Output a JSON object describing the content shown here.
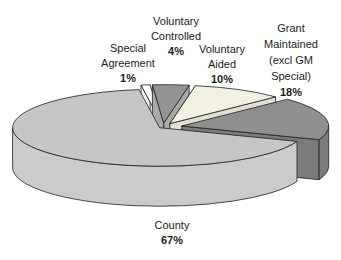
{
  "chart_data": {
    "type": "pie",
    "style": "3d-exploded",
    "legend_position": "none",
    "labels": [
      "Special Agreement",
      "Voluntary Controlled",
      "Voluntary Aided",
      "Grant Maintained (excl GM Special)",
      "County"
    ],
    "values": [
      1,
      4,
      10,
      18,
      67
    ],
    "unit": "%",
    "slices": [
      {
        "id": "special-agreement",
        "label": "Special Agreement",
        "display": "Special\nAgreement",
        "pct": "1%",
        "value": 1,
        "top_color": "#fdfdfd",
        "side_color": "#f2f2f2",
        "explode": 0.1,
        "cuts": "both"
      },
      {
        "id": "voluntary-controlled",
        "label": "Voluntary Controlled",
        "display": "Voluntary\nControlled",
        "pct": "4%",
        "value": 4,
        "top_color": "#949494",
        "side_color": "#a9a9a9",
        "explode": 0.1,
        "cuts": "both"
      },
      {
        "id": "voluntary-aided",
        "label": "Voluntary Aided",
        "display": "Voluntary\nAided",
        "pct": "10%",
        "value": 10,
        "top_color": "#f3f0e4",
        "side_color": "#e4e0d1",
        "explode": 0.1,
        "cuts": "both"
      },
      {
        "id": "grant-maintained",
        "label": "Grant Maintained (excl GM Special)",
        "display": "Grant\nMaintained\n(excl GM\nSpecial)",
        "pct": "18%",
        "value": 18,
        "top_color": "#8f8f8f",
        "side_color": "#7b7b7b",
        "explode": 0.13,
        "cuts": "end"
      },
      {
        "id": "county",
        "label": "County",
        "display": "County",
        "pct": "67%",
        "value": 67,
        "top_color": "#c6c6c6",
        "side_color": "#cbcbcb",
        "explode": 0.03,
        "cuts": "none"
      }
    ]
  }
}
